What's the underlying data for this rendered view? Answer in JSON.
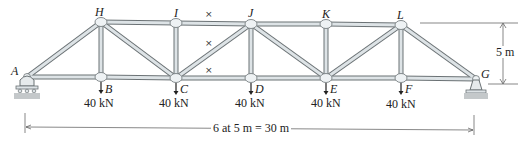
{
  "diagram": {
    "type": "truss",
    "colors": {
      "member_fill": "#dde3e6",
      "member_edge": "#6b7275",
      "joint_fill": "#eef2f4",
      "ground": "#b8bcbe",
      "text": "#222222"
    },
    "joints": {
      "A": {
        "label": "A",
        "x": 27,
        "y": 77
      },
      "B": {
        "label": "B",
        "x": 101,
        "y": 77
      },
      "C": {
        "label": "C",
        "x": 176,
        "y": 78
      },
      "D": {
        "label": "D",
        "x": 251,
        "y": 78
      },
      "E": {
        "label": "E",
        "x": 326,
        "y": 78
      },
      "F": {
        "label": "F",
        "x": 401,
        "y": 78
      },
      "G": {
        "label": "G",
        "x": 476,
        "y": 79
      },
      "H": {
        "label": "H",
        "x": 101,
        "y": 22
      },
      "I": {
        "label": "I",
        "x": 176,
        "y": 23
      },
      "J": {
        "label": "J",
        "x": 251,
        "y": 24
      },
      "K": {
        "label": "K",
        "x": 326,
        "y": 24
      },
      "L": {
        "label": "L",
        "x": 401,
        "y": 25
      }
    },
    "members": [
      [
        "A",
        "B"
      ],
      [
        "B",
        "C"
      ],
      [
        "C",
        "D"
      ],
      [
        "D",
        "E"
      ],
      [
        "E",
        "F"
      ],
      [
        "F",
        "G"
      ],
      [
        "H",
        "I"
      ],
      [
        "I",
        "J"
      ],
      [
        "J",
        "K"
      ],
      [
        "K",
        "L"
      ],
      [
        "A",
        "H"
      ],
      [
        "L",
        "G"
      ],
      [
        "H",
        "B"
      ],
      [
        "I",
        "C"
      ],
      [
        "J",
        "D"
      ],
      [
        "K",
        "E"
      ],
      [
        "L",
        "F"
      ],
      [
        "H",
        "C"
      ],
      [
        "C",
        "J"
      ],
      [
        "J",
        "E"
      ],
      [
        "E",
        "L"
      ]
    ],
    "loads": [
      {
        "joint": "B",
        "value": "40 kN"
      },
      {
        "joint": "C",
        "value": "40 kN"
      },
      {
        "joint": "D",
        "value": "40 kN"
      },
      {
        "joint": "E",
        "value": "40 kN"
      },
      {
        "joint": "F",
        "value": "40 kN"
      }
    ],
    "cut_marks": [
      "×",
      "×",
      "×"
    ],
    "dimensions": {
      "height": "5 m",
      "span": "6 at 5 m = 30 m"
    },
    "supports": {
      "A": "roller",
      "G": "pin"
    }
  }
}
